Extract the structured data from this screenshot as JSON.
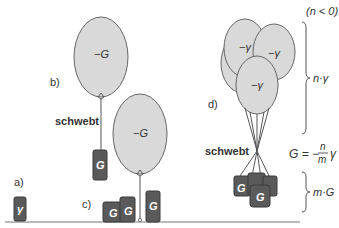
{
  "labels": {
    "a": "a)",
    "b": "b)",
    "c": "c)",
    "d": "d)",
    "schwebt_b": "schwebt",
    "schwebt_d": "schwebt",
    "n_condition": "(n < 0)",
    "n_gamma": "n·γ",
    "m_G": "m·G",
    "formula_lhs": "G = −",
    "formula_num": "n",
    "formula_den": "m",
    "formula_rhs": "γ"
  },
  "balloons": {
    "b": "−G",
    "c": "−G",
    "d1": "−γ",
    "d2": "−γ",
    "d3": "−γ"
  },
  "boxes": {
    "a": "γ",
    "b": "G",
    "c1": "G",
    "c2": "G",
    "c3": "G",
    "d1": "G",
    "d2": "G",
    "d3": "G"
  },
  "colors": {
    "balloon_fill": "#d9d9d9",
    "box_fill": "#5a5a5a",
    "ground": "#666666"
  }
}
